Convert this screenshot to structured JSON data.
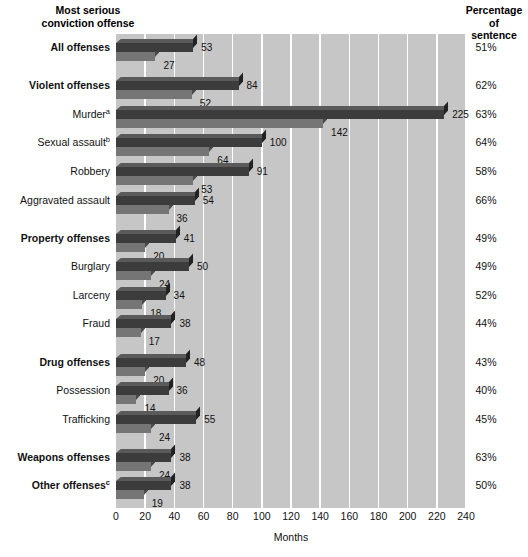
{
  "header": {
    "left_title": "Most serious\nconviction offense",
    "right_title": "Percentage\nof\nsentence"
  },
  "axis": {
    "xlabel": "Months",
    "ticks": [
      "0",
      "20",
      "40",
      "60",
      "80",
      "100",
      "120",
      "140",
      "160",
      "180",
      "200",
      "220",
      "240"
    ],
    "xlim": [
      0,
      240
    ]
  },
  "colors": {
    "plot_background": "#c6c6c6",
    "gridline": "#ffffff",
    "bar_sentence": "#3c3c3c",
    "bar_served": "#757575",
    "page_background": "#ffffff",
    "text": "#111111"
  },
  "footnotes": {
    "a": "a",
    "b": "b",
    "c": "c"
  },
  "chart_data": {
    "type": "bar",
    "orientation": "horizontal",
    "title": "",
    "xlabel": "Months",
    "ylabel": "Most serious conviction offense",
    "xlim": [
      0,
      240
    ],
    "grid": true,
    "legend": "none",
    "series": [
      {
        "name": "Mean maximum sentence length",
        "key": "sentence"
      },
      {
        "name": "Mean time to be served",
        "key": "served"
      }
    ],
    "rows": [
      {
        "label": "All offenses",
        "sup": "",
        "bold": true,
        "sentence": 53,
        "served": 27,
        "percentage": "51%",
        "gap": false
      },
      {
        "label": "Violent offenses",
        "sup": "",
        "bold": true,
        "sentence": 84,
        "served": 52,
        "percentage": "62%",
        "gap": true
      },
      {
        "label": "Murder",
        "sup": "a",
        "bold": false,
        "sentence": 225,
        "served": 142,
        "percentage": "63%",
        "gap": false
      },
      {
        "label": "Sexual assault",
        "sup": "b",
        "bold": false,
        "sentence": 100,
        "served": 64,
        "percentage": "64%",
        "gap": false
      },
      {
        "label": "Robbery",
        "sup": "",
        "bold": false,
        "sentence": 91,
        "served": 53,
        "percentage": "58%",
        "gap": false
      },
      {
        "label": "Aggravated assault",
        "sup": "",
        "bold": false,
        "sentence": 54,
        "served": 36,
        "percentage": "66%",
        "gap": false
      },
      {
        "label": "Property offenses",
        "sup": "",
        "bold": true,
        "sentence": 41,
        "served": 20,
        "percentage": "49%",
        "gap": true
      },
      {
        "label": "Burglary",
        "sup": "",
        "bold": false,
        "sentence": 50,
        "served": 24,
        "percentage": "49%",
        "gap": false
      },
      {
        "label": "Larceny",
        "sup": "",
        "bold": false,
        "sentence": 34,
        "served": 18,
        "percentage": "52%",
        "gap": false
      },
      {
        "label": "Fraud",
        "sup": "",
        "bold": false,
        "sentence": 38,
        "served": 17,
        "percentage": "44%",
        "gap": false
      },
      {
        "label": "Drug offenses",
        "sup": "",
        "bold": true,
        "sentence": 48,
        "served": 20,
        "percentage": "43%",
        "gap": true
      },
      {
        "label": "Possession",
        "sup": "",
        "bold": false,
        "sentence": 36,
        "served": 14,
        "percentage": "40%",
        "gap": false
      },
      {
        "label": "Trafficking",
        "sup": "",
        "bold": false,
        "sentence": 55,
        "served": 24,
        "percentage": "45%",
        "gap": false
      },
      {
        "label": "Weapons offenses",
        "sup": "",
        "bold": true,
        "sentence": 38,
        "served": 24,
        "percentage": "63%",
        "gap": true
      },
      {
        "label": "Other offenses",
        "sup": "c",
        "bold": true,
        "sentence": 38,
        "served": 19,
        "percentage": "50%",
        "gap": false
      }
    ]
  }
}
